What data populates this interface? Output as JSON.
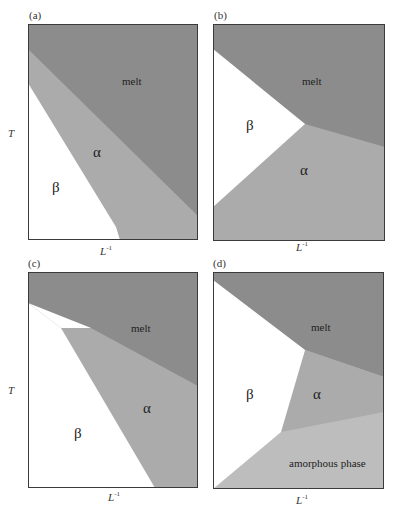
{
  "colors": {
    "melt": "#8c8c8c",
    "alpha": "#ababab",
    "beta": "#ffffff",
    "amorphous": "#bdbdbd",
    "frame": "#3a3a3a"
  },
  "axes": {
    "y_label": "T",
    "x_label": "L",
    "x_label_sup": "-1"
  },
  "panels": [
    {
      "id": "a",
      "label": "(a)",
      "regions": [
        {
          "name": "melt",
          "label": "melt"
        },
        {
          "name": "alpha",
          "label": "α"
        },
        {
          "name": "beta",
          "label": "β"
        }
      ]
    },
    {
      "id": "b",
      "label": "(b)",
      "regions": [
        {
          "name": "melt",
          "label": "melt"
        },
        {
          "name": "beta",
          "label": "β"
        },
        {
          "name": "alpha",
          "label": "α"
        }
      ]
    },
    {
      "id": "c",
      "label": "(c)",
      "regions": [
        {
          "name": "melt",
          "label": "melt"
        },
        {
          "name": "alpha",
          "label": "α"
        },
        {
          "name": "beta",
          "label": "β"
        }
      ]
    },
    {
      "id": "d",
      "label": "(d)",
      "regions": [
        {
          "name": "melt",
          "label": "melt"
        },
        {
          "name": "beta",
          "label": "β"
        },
        {
          "name": "alpha",
          "label": "α"
        },
        {
          "name": "amorphous",
          "label": "amorphous phase"
        }
      ]
    }
  ]
}
